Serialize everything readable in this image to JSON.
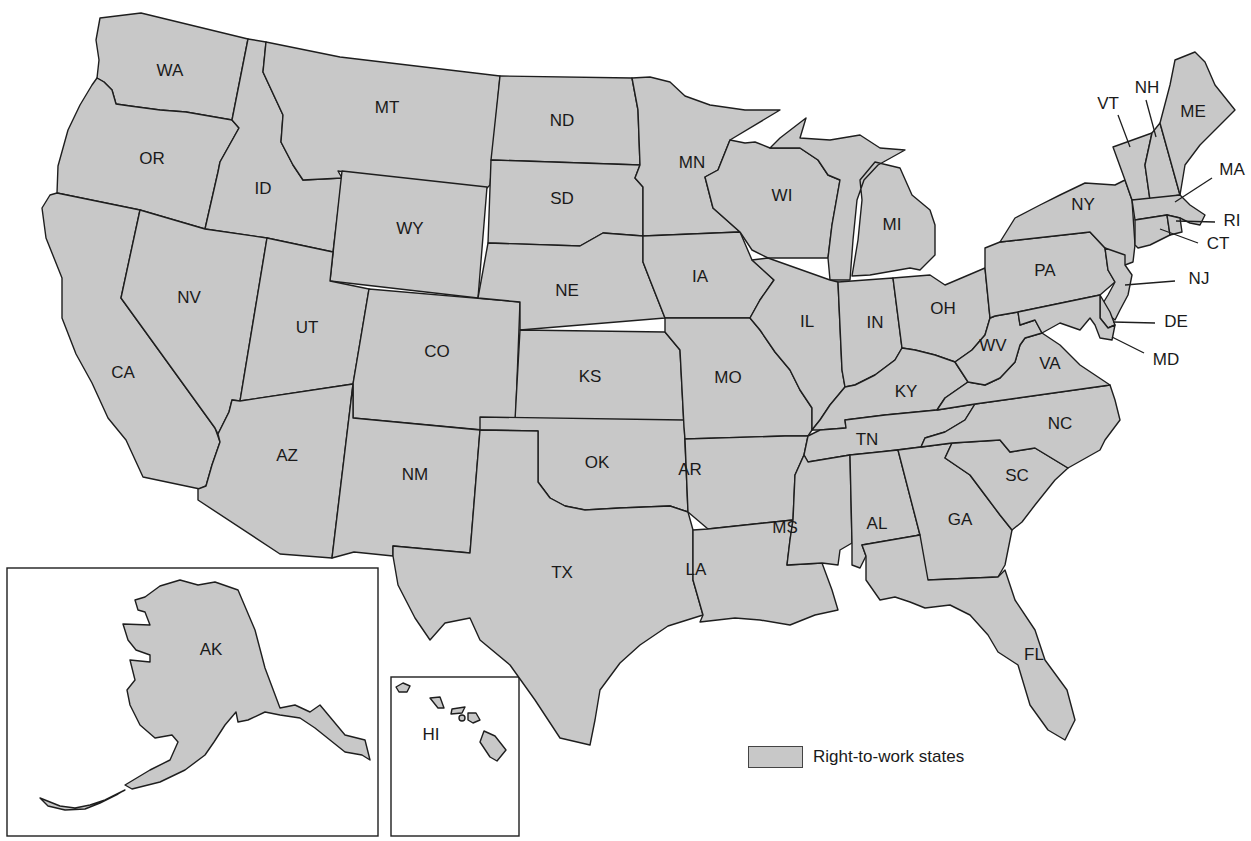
{
  "map": {
    "title": "",
    "fill_color": "#c8c8c8",
    "stroke_color": "#1e1e1e",
    "states": [
      {
        "abbr": "WA",
        "shaded": true
      },
      {
        "abbr": "OR",
        "shaded": true
      },
      {
        "abbr": "CA",
        "shaded": true
      },
      {
        "abbr": "ID",
        "shaded": true
      },
      {
        "abbr": "NV",
        "shaded": true
      },
      {
        "abbr": "MT",
        "shaded": true
      },
      {
        "abbr": "WY",
        "shaded": true
      },
      {
        "abbr": "UT",
        "shaded": true
      },
      {
        "abbr": "AZ",
        "shaded": true
      },
      {
        "abbr": "CO",
        "shaded": true
      },
      {
        "abbr": "NM",
        "shaded": true
      },
      {
        "abbr": "ND",
        "shaded": true
      },
      {
        "abbr": "SD",
        "shaded": true
      },
      {
        "abbr": "NE",
        "shaded": true
      },
      {
        "abbr": "KS",
        "shaded": true
      },
      {
        "abbr": "OK",
        "shaded": true
      },
      {
        "abbr": "TX",
        "shaded": true
      },
      {
        "abbr": "MN",
        "shaded": true
      },
      {
        "abbr": "IA",
        "shaded": true
      },
      {
        "abbr": "MO",
        "shaded": true
      },
      {
        "abbr": "AR",
        "shaded": true
      },
      {
        "abbr": "LA",
        "shaded": true
      },
      {
        "abbr": "WI",
        "shaded": true
      },
      {
        "abbr": "IL",
        "shaded": true
      },
      {
        "abbr": "MI",
        "shaded": true
      },
      {
        "abbr": "IN",
        "shaded": true
      },
      {
        "abbr": "OH",
        "shaded": true
      },
      {
        "abbr": "KY",
        "shaded": true
      },
      {
        "abbr": "TN",
        "shaded": true
      },
      {
        "abbr": "MS",
        "shaded": true
      },
      {
        "abbr": "AL",
        "shaded": true
      },
      {
        "abbr": "GA",
        "shaded": true
      },
      {
        "abbr": "FL",
        "shaded": true
      },
      {
        "abbr": "SC",
        "shaded": true
      },
      {
        "abbr": "NC",
        "shaded": true
      },
      {
        "abbr": "VA",
        "shaded": true
      },
      {
        "abbr": "WV",
        "shaded": true
      },
      {
        "abbr": "PA",
        "shaded": true
      },
      {
        "abbr": "NY",
        "shaded": true
      },
      {
        "abbr": "NJ",
        "shaded": true
      },
      {
        "abbr": "DE",
        "shaded": true
      },
      {
        "abbr": "MD",
        "shaded": true
      },
      {
        "abbr": "CT",
        "shaded": true
      },
      {
        "abbr": "RI",
        "shaded": true
      },
      {
        "abbr": "MA",
        "shaded": true
      },
      {
        "abbr": "VT",
        "shaded": true
      },
      {
        "abbr": "NH",
        "shaded": true
      },
      {
        "abbr": "ME",
        "shaded": true
      },
      {
        "abbr": "AK",
        "shaded": true
      },
      {
        "abbr": "HI",
        "shaded": true
      }
    ],
    "labels": {
      "WA": "WA",
      "OR": "OR",
      "CA": "CA",
      "ID": "ID",
      "NV": "NV",
      "MT": "MT",
      "WY": "WY",
      "UT": "UT",
      "AZ": "AZ",
      "CO": "CO",
      "NM": "NM",
      "ND": "ND",
      "SD": "SD",
      "NE": "NE",
      "KS": "KS",
      "OK": "OK",
      "TX": "TX",
      "MN": "MN",
      "IA": "IA",
      "MO": "MO",
      "AR": "AR",
      "LA": "LA",
      "WI": "WI",
      "IL": "IL",
      "MI": "MI",
      "IN": "IN",
      "OH": "OH",
      "KY": "KY",
      "TN": "TN",
      "MS": "MS",
      "AL": "AL",
      "GA": "GA",
      "FL": "FL",
      "SC": "SC",
      "NC": "NC",
      "VA": "VA",
      "WV": "WV",
      "PA": "PA",
      "NY": "NY",
      "NJ": "NJ",
      "DE": "DE",
      "MD": "MD",
      "CT": "CT",
      "RI": "RI",
      "MA": "MA",
      "VT": "VT",
      "NH": "NH",
      "ME": "ME",
      "AK": "AK",
      "HI": "HI"
    },
    "insets": [
      "Alaska",
      "Hawaii"
    ]
  },
  "legend": {
    "swatch_color": "#c8c8c8",
    "label": "Right-to-work states"
  }
}
